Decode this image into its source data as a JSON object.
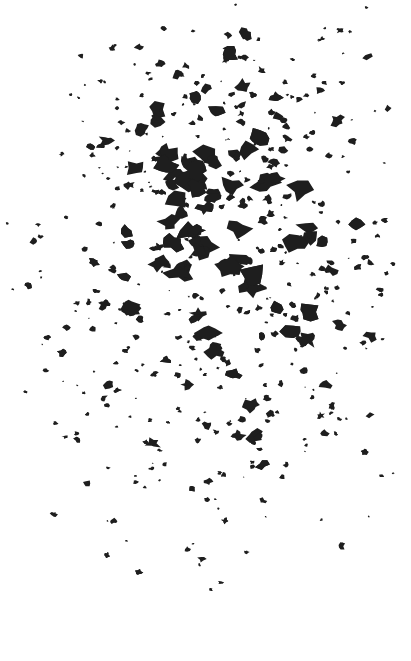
{
  "image": {
    "subject": "abstract black ink blot / stipple texture",
    "background_color": "#ffffff",
    "ink_color": "#1e1e1e",
    "width": 411,
    "height": 661
  }
}
